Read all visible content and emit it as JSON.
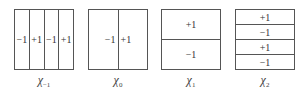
{
  "panels": [
    {
      "symbol": "χ",
      "subscript": "−1",
      "orientation": "vertical",
      "cells": [
        "−1",
        "+1",
        "−1",
        "+1"
      ]
    },
    {
      "symbol": "χ",
      "subscript": "0",
      "orientation": "vertical",
      "cells": [
        "−1",
        "+1"
      ]
    },
    {
      "symbol": "χ",
      "subscript": "1",
      "orientation": "horizontal",
      "cells": [
        "+1",
        "−1"
      ]
    },
    {
      "symbol": "χ",
      "subscript": "2",
      "orientation": "horizontal",
      "cells": [
        "+1",
        "−1",
        "+1",
        "−1"
      ]
    }
  ]
}
